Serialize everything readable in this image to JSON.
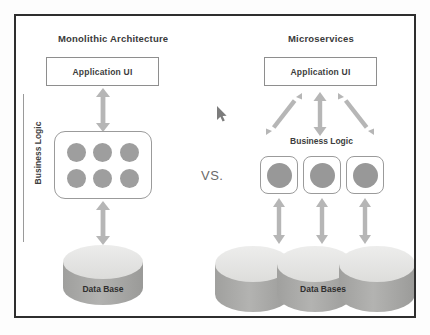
{
  "diagram": {
    "title_monolithic": "Monolithic Architecture",
    "title_microservices": "Microservices",
    "comparison_label": "VS.",
    "monolithic": {
      "ui_label": "Application UI",
      "business_logic_label": "Business Logic",
      "module_count": 6,
      "database_label": "Data Base",
      "database_count": 1
    },
    "microservices": {
      "ui_label": "Application UI",
      "business_logic_label": "Business Logic",
      "service_count": 3,
      "database_label": "Data Bases",
      "database_count": 3
    }
  },
  "colors": {
    "frame_border": "#2e2e2e",
    "box_border": "#8e8e8e",
    "module_fill": "#9e9e9e",
    "arrow": "#b0b0b0",
    "cylinder_top": "#e3e3e3",
    "cylinder_body": "#a8a8a8",
    "text": "#3a3a3a",
    "background": "#ffffff"
  },
  "cursor": {
    "icon": "mouse-pointer-icon",
    "x": 200,
    "y": 90
  }
}
